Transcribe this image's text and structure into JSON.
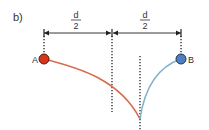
{
  "panel_label": "b)",
  "dimensions": [
    {
      "numerator": "d",
      "denominator": "2"
    },
    {
      "numerator": "d",
      "denominator": "2"
    }
  ],
  "points": {
    "a": {
      "label": "A",
      "color": "#d4361c"
    },
    "b": {
      "label": "B",
      "color": "#4f7fbf"
    }
  },
  "curves": {
    "a_color": "#d9694f",
    "b_color": "#7fb3cc"
  }
}
